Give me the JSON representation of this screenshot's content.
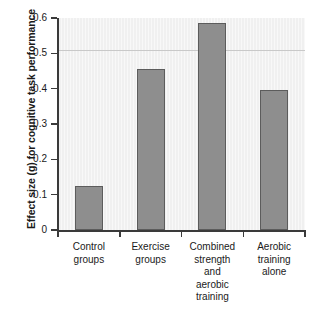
{
  "chart_data": {
    "type": "bar",
    "title": "",
    "xlabel": "",
    "ylabel": "Effect size (g) for cognitive task performance",
    "ylim": [
      0,
      0.6
    ],
    "grid": false,
    "legend": "none",
    "categories": [
      "Control\ngroups",
      "Exercise\ngroups",
      "Combined\nstrength\nand\naerobic\ntraining",
      "Aerobic\ntraining\nalone"
    ],
    "values": [
      0.125,
      0.455,
      0.587,
      0.395
    ],
    "ytick_labels": [
      "0.6",
      "0.5",
      "0.4",
      "0.3",
      "0.2",
      "0.1",
      "0"
    ],
    "ytick_values": [
      0.6,
      0.5,
      0.4,
      0.3,
      0.2,
      0.1,
      0
    ],
    "annotations": [
      {
        "kind": "reference-line",
        "orientation": "horizontal",
        "value": 0.51,
        "label": ""
      }
    ],
    "colors": {
      "bar_fill": "#8e8e8e",
      "bar_edge": "#5c5c5c",
      "plot_background": "#f0f0f0",
      "axis": "#3a3a3a",
      "reference_line": "#c9c9c9",
      "text": "#1a1a1a"
    }
  }
}
